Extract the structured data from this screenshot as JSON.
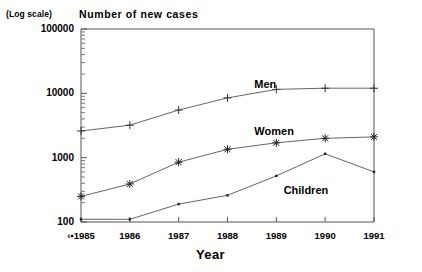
{
  "chart_data": {
    "type": "line",
    "title": "Number of new cases",
    "note": "(Log scale)",
    "xlabel": "Year",
    "ylabel": "Number of new cases",
    "yscale": "log",
    "ylim": [
      100,
      100000
    ],
    "ytick_labels": [
      "100000",
      "10000",
      "1000",
      "100"
    ],
    "ytick_values": [
      100000,
      10000,
      1000,
      100
    ],
    "grid": false,
    "legend": "inline-annotations",
    "x": [
      1985,
      1986,
      1987,
      1988,
      1989,
      1990,
      1991
    ],
    "xtick_labels": [
      "1985",
      "1986",
      "1987",
      "1988",
      "1989",
      "1990",
      "1991"
    ],
    "x_origin_glyph": "‹▪",
    "series": [
      {
        "name": "Men",
        "marker": "plus",
        "values": [
          2600,
          3200,
          5500,
          8500,
          11500,
          12000,
          12000
        ]
      },
      {
        "name": "Women",
        "marker": "asterisk",
        "values": [
          250,
          390,
          850,
          1350,
          1700,
          2000,
          2100
        ]
      },
      {
        "name": "Children",
        "marker": "dot",
        "values": [
          110,
          110,
          190,
          260,
          520,
          1150,
          600
        ]
      }
    ],
    "annotations": [
      {
        "text": "Men",
        "x": 1989.0,
        "y_px": 78
      },
      {
        "text": "Women",
        "x": 1989.0,
        "y_px": 125
      },
      {
        "text": "Children",
        "x": 1989.6,
        "y_px": 184
      }
    ],
    "colors": {
      "axis": "#555555",
      "line": "#666666",
      "text": "#000000",
      "background": "#ffffff"
    }
  }
}
